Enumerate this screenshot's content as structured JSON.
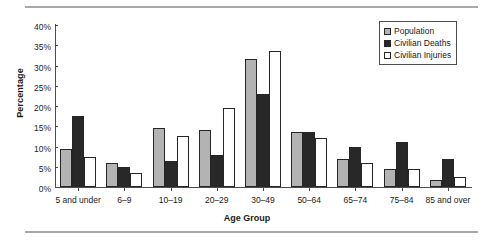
{
  "chart_data": {
    "type": "bar",
    "title": "",
    "xlabel": "Age Group",
    "ylabel": "Percentage",
    "ylim": [
      0,
      40
    ],
    "yticks": [
      "0%",
      "5%",
      "10%",
      "15%",
      "20%",
      "25%",
      "30%",
      "35%",
      "40%"
    ],
    "ytick_values": [
      0,
      5,
      10,
      15,
      20,
      25,
      30,
      35,
      40
    ],
    "grid": false,
    "legend_position": "top-right",
    "categories": [
      "5 and under",
      "6–9",
      "10–19",
      "20–29",
      "30–49",
      "50–64",
      "65–74",
      "75–84",
      "85 and over"
    ],
    "series": [
      {
        "name": "Population",
        "color": "#b3b3b3",
        "values": [
          9.5,
          6.0,
          14.5,
          14.0,
          31.5,
          13.5,
          7.0,
          4.5,
          1.8
        ]
      },
      {
        "name": "Civilian Deaths",
        "color": "#282828",
        "values": [
          17.5,
          5.0,
          6.5,
          8.0,
          23.0,
          13.5,
          10.0,
          11.0,
          7.0
        ]
      },
      {
        "name": "Civilian Injuries",
        "color": "#ffffff",
        "values": [
          7.5,
          3.5,
          12.5,
          19.5,
          33.5,
          12.0,
          6.0,
          4.5,
          2.5
        ]
      }
    ]
  }
}
